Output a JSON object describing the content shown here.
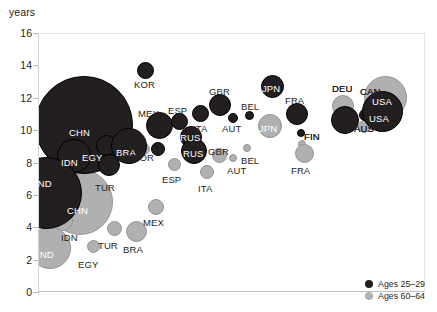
{
  "chart_data": {
    "type": "scatter",
    "title": "",
    "ylabel": "years",
    "xlabel": "",
    "ylim": [
      0,
      16
    ],
    "yticks": [
      0,
      2,
      4,
      6,
      8,
      10,
      12,
      14,
      16
    ],
    "grid": false,
    "legend_position": "bottom-right",
    "legend": [
      {
        "name": "Ages 25–29",
        "color": "#231f20"
      },
      {
        "name": "Ages 60–64",
        "color": "#b0b0b0"
      }
    ],
    "series": [
      {
        "name": "Ages 25–29",
        "color": "#231f20",
        "points": [
          {
            "label": "CHN",
            "y": 10.9,
            "size": 98,
            "px": 83,
            "py": 124,
            "lx": 68,
            "ly": 127,
            "anchor": "inside"
          },
          {
            "label": "EGY",
            "y": 9.7,
            "size": 21,
            "px": 105,
            "py": 144,
            "lx": 81,
            "ly": 152,
            "anchor": "inside"
          },
          {
            "label": "IDN",
            "y": 8.5,
            "size": 34,
            "px": 73,
            "py": 155,
            "lx": 60,
            "ly": 157,
            "anchor": "inside"
          },
          {
            "label": "IND",
            "y": 6.2,
            "size": 72,
            "px": 45,
            "py": 192,
            "lx": 34,
            "ly": 178,
            "anchor": "inside"
          },
          {
            "label": "TUR",
            "y": 8.2,
            "size": 22,
            "px": 108,
            "py": 164,
            "lx": 94,
            "ly": 182,
            "anchor": "outside"
          },
          {
            "label": "BRA",
            "y": 9.6,
            "size": 36,
            "px": 128,
            "py": 145,
            "lx": 115,
            "ly": 147,
            "anchor": "inside"
          },
          {
            "label": "KOR",
            "y": 13.7,
            "size": 17,
            "px": 144,
            "py": 69,
            "lx": 133,
            "ly": 79,
            "anchor": "outside"
          },
          {
            "label": "MEX",
            "y": 10.9,
            "size": 27,
            "px": 158,
            "py": 124,
            "lx": 137,
            "ly": 108,
            "anchor": "outside"
          },
          {
            "label": "KOR",
            "y": 9.5,
            "size": 14,
            "px": 157,
            "py": 148,
            "lx": 117,
            "ly": 152,
            "anchor": "outside"
          },
          {
            "label": "ESP",
            "y": 11.3,
            "size": 17,
            "px": 178,
            "py": 120,
            "lx": 167,
            "ly": 105,
            "anchor": "outside"
          },
          {
            "label": "ITA",
            "y": 11.7,
            "size": 17,
            "px": 199,
            "py": 112,
            "lx": 192,
            "ly": 123,
            "anchor": "outside"
          },
          {
            "label": "GBR",
            "y": 12.1,
            "size": 22,
            "px": 219,
            "py": 104,
            "lx": 208,
            "ly": 86,
            "anchor": "outside"
          },
          {
            "label": "AUT",
            "y": 11.4,
            "size": 10,
            "px": 232,
            "py": 117,
            "lx": 221,
            "ly": 123,
            "anchor": "outside"
          },
          {
            "label": "RUS",
            "y": 10.0,
            "size": 22,
            "px": 190,
            "py": 136,
            "lx": 179,
            "ly": 132,
            "anchor": "inside"
          },
          {
            "label": "RUS",
            "y": 9.4,
            "size": 26,
            "px": 193,
            "py": 150,
            "lx": 182,
            "ly": 148,
            "anchor": "inside"
          },
          {
            "label": "BEL",
            "y": 11.6,
            "size": 9,
            "px": 248,
            "py": 114,
            "lx": 240,
            "ly": 101,
            "anchor": "outside"
          },
          {
            "label": "JPN",
            "y": 13.1,
            "size": 23,
            "px": 271,
            "py": 85,
            "lx": 261,
            "ly": 83,
            "anchor": "inside"
          },
          {
            "label": "FRA",
            "y": 11.6,
            "size": 22,
            "px": 296,
            "py": 113,
            "lx": 284,
            "ly": 95,
            "anchor": "outside"
          },
          {
            "label": "DEU",
            "y": 11.0,
            "size": 28,
            "px": 344,
            "py": 119,
            "lx": 331,
            "ly": 83,
            "anchor": "outside"
          },
          {
            "label": "AUS",
            "y": 11.2,
            "size": 12,
            "px": 364,
            "py": 114,
            "lx": 353,
            "ly": 123,
            "anchor": "outside"
          },
          {
            "label": "CAN",
            "y": 11.5,
            "size": 12,
            "px": 371,
            "py": 113,
            "lx": 359,
            "ly": 86,
            "anchor": "outside"
          },
          {
            "label": "FIN",
            "y": 10.4,
            "size": 8,
            "px": 300,
            "py": 132,
            "lx": 303,
            "ly": 131,
            "anchor": "outside"
          },
          {
            "label": "USA",
            "y": 11.5,
            "size": 41,
            "px": 381,
            "py": 110,
            "lx": 368,
            "ly": 113,
            "anchor": "inside"
          }
        ]
      },
      {
        "name": "Ages 60–64",
        "color": "#b0b0b0",
        "points": [
          {
            "label": "CHN",
            "y": 5.6,
            "size": 66,
            "px": 79,
            "py": 201,
            "lx": 66,
            "ly": 205,
            "anchor": "inside"
          },
          {
            "label": "IDN",
            "y": 4.5,
            "size": 20,
            "px": 62,
            "py": 220,
            "lx": 60,
            "ly": 232,
            "anchor": "outside"
          },
          {
            "label": "IND",
            "y": 3.1,
            "size": 42,
            "px": 49,
            "py": 247,
            "lx": 36,
            "ly": 249,
            "anchor": "inside"
          },
          {
            "label": "EGY",
            "y": 3.3,
            "size": 13,
            "px": 92,
            "py": 245,
            "lx": 77,
            "ly": 259,
            "anchor": "outside"
          },
          {
            "label": "TUR",
            "y": 4.3,
            "size": 15,
            "px": 113,
            "py": 227,
            "lx": 97,
            "ly": 240,
            "anchor": "outside"
          },
          {
            "label": "BRA",
            "y": 4.2,
            "size": 21,
            "px": 135,
            "py": 230,
            "lx": 122,
            "ly": 244,
            "anchor": "outside"
          },
          {
            "label": "MEX",
            "y": 5.7,
            "size": 16,
            "px": 155,
            "py": 206,
            "lx": 142,
            "ly": 217,
            "anchor": "outside"
          },
          {
            "label": "KOR",
            "y": 9.5,
            "size": 12,
            "px": 143,
            "py": 148,
            "lx": 132,
            "ly": 152,
            "anchor": "outside"
          },
          {
            "label": "ESP",
            "y": 8.5,
            "size": 13,
            "px": 173,
            "py": 163,
            "lx": 161,
            "ly": 174,
            "anchor": "outside"
          },
          {
            "label": "ITA",
            "y": 8.0,
            "size": 14,
            "px": 206,
            "py": 171,
            "lx": 197,
            "ly": 183,
            "anchor": "outside"
          },
          {
            "label": "GBR",
            "y": 9.1,
            "size": 15,
            "px": 218,
            "py": 154,
            "lx": 207,
            "ly": 146,
            "anchor": "outside"
          },
          {
            "label": "AUT",
            "y": 8.9,
            "size": 8,
            "px": 232,
            "py": 157,
            "lx": 226,
            "ly": 165,
            "anchor": "outside"
          },
          {
            "label": "BEL",
            "y": 9.5,
            "size": 8,
            "px": 246,
            "py": 147,
            "lx": 240,
            "ly": 155,
            "anchor": "outside"
          },
          {
            "label": "JPN",
            "y": 10.2,
            "size": 24,
            "px": 269,
            "py": 125,
            "lx": 258,
            "ly": 123,
            "anchor": "inside"
          },
          {
            "label": "FIN",
            "y": 9.9,
            "size": 8,
            "px": 301,
            "py": 143,
            "lx": 303,
            "ly": 131,
            "anchor": "outside"
          },
          {
            "label": "FRA",
            "y": 9.0,
            "size": 19,
            "px": 303,
            "py": 152,
            "lx": 290,
            "ly": 165,
            "anchor": "outside"
          },
          {
            "label": "DEU",
            "y": 11.9,
            "size": 22,
            "px": 342,
            "py": 105,
            "lx": 331,
            "ly": 83,
            "anchor": "outside"
          },
          {
            "label": "AUS",
            "y": 10.8,
            "size": 13,
            "px": 363,
            "py": 125,
            "lx": 353,
            "ly": 123,
            "anchor": "outside"
          },
          {
            "label": "CAN",
            "y": 11.4,
            "size": 11,
            "px": 372,
            "py": 113,
            "lx": 359,
            "ly": 86,
            "anchor": "outside"
          },
          {
            "label": "USA",
            "y": 12.1,
            "size": 43,
            "px": 384,
            "py": 96,
            "lx": 371,
            "ly": 96,
            "anchor": "inside"
          }
        ]
      }
    ]
  },
  "legend": {
    "items": [
      {
        "label": "Ages 25–29",
        "tone": "dark"
      },
      {
        "label": "Ages 60–64",
        "tone": "light"
      }
    ]
  },
  "axis": {
    "y_title": "years"
  }
}
